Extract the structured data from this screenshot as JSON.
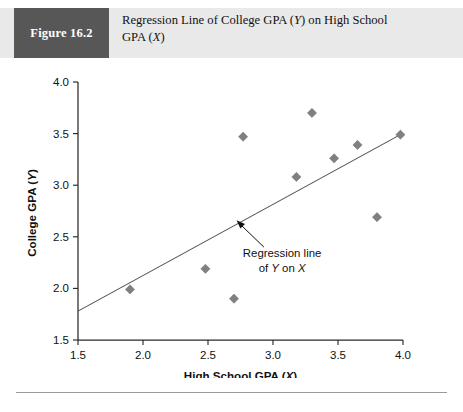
{
  "figure": {
    "label": "Figure 16.2",
    "caption_line1": "Regression Line of College GPA (Y) on High School",
    "caption_line2": "GPA (X)",
    "caption_plain": "Regression Line of College GPA (Y) on High School GPA (X)"
  },
  "colors": {
    "header_band": "#e9e9e9",
    "label_box": "#575757",
    "label_text": "#ffffff",
    "marker": "#808080",
    "regression_line": "#4d4d4d",
    "axis": "#2a2a2a",
    "rule": "#9a9a9a"
  },
  "annotation": {
    "line1": "Regression line",
    "line2_prefix": "of ",
    "line2_y": "Y",
    "line2_mid": " on ",
    "line2_x": "X",
    "line2_plain": "of Y on X"
  },
  "chart_data": {
    "type": "scatter",
    "title": "Regression Line of College GPA (Y) on High School GPA (X)",
    "xlabel": "High School GPA (X)",
    "ylabel": "College GPA (Y)",
    "xlim": [
      1.5,
      4.0
    ],
    "ylim": [
      1.5,
      4.0
    ],
    "xticks": [
      1.5,
      2.0,
      2.5,
      3.0,
      3.5,
      4.0
    ],
    "yticks": [
      1.5,
      2.0,
      2.5,
      3.0,
      3.5,
      4.0
    ],
    "xticklabels": [
      "1.5",
      "2.0",
      "2.5",
      "3.0",
      "3.5",
      "4.0"
    ],
    "yticklabels": [
      "1.5",
      "2.0",
      "2.5",
      "3.0",
      "3.5",
      "4.0"
    ],
    "grid": false,
    "legend": false,
    "marker_style": "diamond",
    "points": [
      {
        "x": 1.9,
        "y": 1.99
      },
      {
        "x": 2.48,
        "y": 2.19
      },
      {
        "x": 2.7,
        "y": 1.9
      },
      {
        "x": 2.77,
        "y": 3.47
      },
      {
        "x": 3.18,
        "y": 3.08
      },
      {
        "x": 3.3,
        "y": 3.7
      },
      {
        "x": 3.47,
        "y": 3.26
      },
      {
        "x": 3.65,
        "y": 3.39
      },
      {
        "x": 3.8,
        "y": 2.69
      },
      {
        "x": 3.98,
        "y": 3.49
      }
    ],
    "regression_line": {
      "x_start": 1.5,
      "y_start": 1.78,
      "x_end": 3.98,
      "y_end": 3.49,
      "label": "Regression line of Y on X"
    },
    "annotation_arrow": {
      "tip_x": 2.72,
      "tip_y": 2.66,
      "tail_x": 2.93,
      "tail_y": 2.4
    }
  }
}
